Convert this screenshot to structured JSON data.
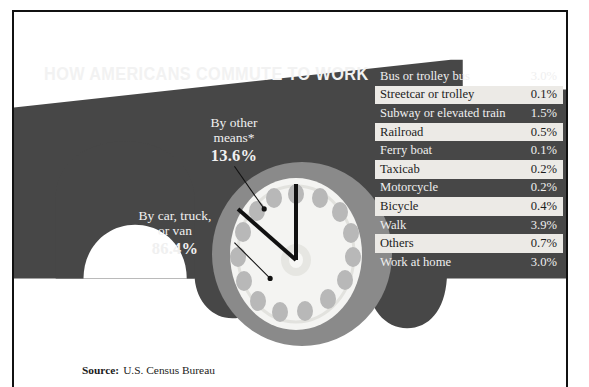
{
  "title": "HOW AMERICANS COMMUTE TO WORK",
  "callouts": {
    "other": {
      "line1": "By other",
      "line2": "means*",
      "percent": "13.6%"
    },
    "car": {
      "line1": "By car, truck,",
      "line2": "or van",
      "percent": "86.4%"
    }
  },
  "table": {
    "header": "*Other means of commuting",
    "rows": [
      {
        "label": "Bus or trolley bus",
        "value": "3.0%"
      },
      {
        "label": "Streetcar or trolley",
        "value": "0.1%"
      },
      {
        "label": "Subway or elevated train",
        "value": "1.5%"
      },
      {
        "label": "Railroad",
        "value": "0.5%"
      },
      {
        "label": "Ferry boat",
        "value": "0.1%"
      },
      {
        "label": "Taxicab",
        "value": "0.2%"
      },
      {
        "label": "Motorcycle",
        "value": "0.2%"
      },
      {
        "label": "Bicycle",
        "value": "0.4%"
      },
      {
        "label": "Walk",
        "value": "3.9%"
      },
      {
        "label": "Others",
        "value": "0.7%"
      },
      {
        "label": "Work at home",
        "value": "3.0%"
      }
    ]
  },
  "source": {
    "label": "Source:",
    "text": "U.S. Census Bureau"
  },
  "colors": {
    "body_dark": "#474747",
    "tire_gray": "#8a8a8a",
    "wheel_white": "#f4f4f2",
    "lug_gray": "#b7b7b7",
    "row_light": "#eceae6",
    "text_light": "#f0f0f0",
    "line_black": "#111111"
  },
  "chart_data": {
    "type": "pie",
    "title": "HOW AMERICANS COMMUTE TO WORK",
    "categories": [
      "By car, truck, or van",
      "By other means*"
    ],
    "values": [
      86.4,
      13.6
    ],
    "unit": "%",
    "legend": "none",
    "breakdown_title": "*Other means of commuting",
    "breakdown_categories": [
      "Bus or trolley bus",
      "Streetcar or trolley",
      "Subway or elevated train",
      "Railroad",
      "Ferry boat",
      "Taxicab",
      "Motorcycle",
      "Bicycle",
      "Walk",
      "Others",
      "Work at home"
    ],
    "breakdown_values": [
      3.0,
      0.1,
      1.5,
      0.5,
      0.1,
      0.2,
      0.2,
      0.4,
      3.9,
      0.7,
      3.0
    ],
    "source": "U.S. Census Bureau"
  }
}
